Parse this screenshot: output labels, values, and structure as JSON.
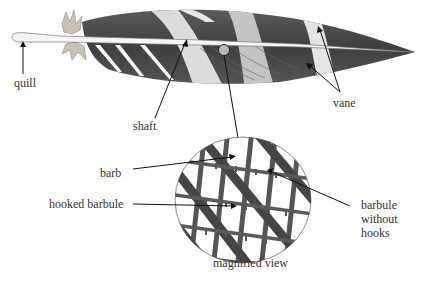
{
  "diagram": {
    "labels": {
      "quill": "quill",
      "shaft": "shaft",
      "vane": "vane",
      "barb": "barb",
      "hooked_barbule": "hooked barbule",
      "barbule_without_hooks_line1": "barbule",
      "barbule_without_hooks_line2": "without",
      "barbule_without_hooks_line3": "hooks",
      "magnified_view": "magnified view"
    },
    "colors": {
      "background": "#ffffff",
      "vane_dark": "#4a4a4a",
      "vane_light": "#d9d9d9",
      "shaft": "#f2f2f2",
      "text": "#333333",
      "arrow": "#111111"
    }
  }
}
